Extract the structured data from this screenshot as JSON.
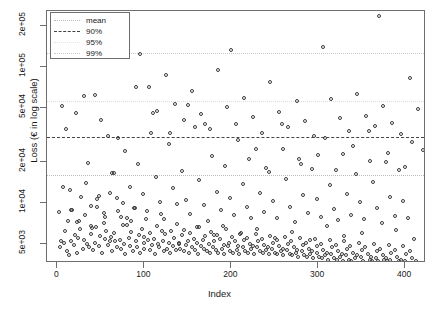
{
  "chart_data": {
    "type": "scatter",
    "title": "",
    "xlabel": "Index",
    "ylabel": "Loss (€ in log scale)",
    "xlim": [
      -12,
      424
    ],
    "ylim_log": [
      3600,
      260000
    ],
    "yscale": "log",
    "grid": false,
    "legend_position": "top-left",
    "xticks": [
      0,
      100,
      200,
      300,
      400
    ],
    "xticklabels": [
      "0",
      "100",
      "200",
      "300",
      "400"
    ],
    "yticks": [
      5000,
      10000,
      20000,
      50000,
      100000,
      200000
    ],
    "yticklabels": [
      "5e+03",
      "1e+04",
      "2e+04",
      "5e+04",
      "1e+05",
      "2e+05"
    ],
    "marker": "open-circle",
    "marker_color": "#3a3a3a",
    "n_points": 420,
    "reference_lines": [
      {
        "name": "mean",
        "label": "mean",
        "value": 16000,
        "style": "dotted",
        "color": "#bbbbbb",
        "width": 1
      },
      {
        "name": "q90",
        "label": "90%",
        "value": 30500,
        "style": "dashed",
        "color": "#444444",
        "width": 1
      },
      {
        "name": "q95",
        "label": "95%",
        "value": 56000,
        "style": "dotted",
        "color": "#dcdcdc",
        "width": 1
      },
      {
        "name": "q99",
        "label": "99%",
        "value": 128000,
        "style": "dotted",
        "color": "#c9c9c9",
        "width": 1
      }
    ],
    "legend_entries": [
      "mean",
      "90%",
      "95%",
      "99%"
    ],
    "x": [
      2,
      4,
      5,
      7,
      9,
      11,
      12,
      14,
      16,
      17,
      19,
      21,
      22,
      24,
      26,
      27,
      29,
      31,
      32,
      34,
      36,
      38,
      39,
      41,
      43,
      44,
      46,
      48,
      49,
      51,
      53,
      55,
      56,
      58,
      60,
      61,
      63,
      65,
      66,
      68,
      70,
      72,
      73,
      75,
      77,
      78,
      80,
      82,
      83,
      85,
      87,
      89,
      90,
      92,
      94,
      95,
      97,
      99,
      100,
      102,
      104,
      106,
      107,
      109,
      111,
      112,
      114,
      116,
      117,
      119,
      121,
      123,
      124,
      126,
      128,
      129,
      131,
      133,
      134,
      136,
      138,
      140,
      141,
      143,
      145,
      146,
      148,
      150,
      151,
      153,
      155,
      157,
      158,
      160,
      162,
      163,
      165,
      167,
      168,
      170,
      172,
      174,
      175,
      177,
      179,
      180,
      182,
      184,
      185,
      187,
      189,
      191,
      192,
      194,
      196,
      197,
      199,
      201,
      202,
      204,
      206,
      208,
      209,
      211,
      213,
      214,
      216,
      218,
      219,
      221,
      223,
      225,
      226,
      228,
      230,
      231,
      233,
      235,
      236,
      238,
      240,
      242,
      243,
      245,
      247,
      248,
      250,
      252,
      253,
      255,
      257,
      259,
      260,
      262,
      264,
      265,
      267,
      269,
      270,
      272,
      274,
      276,
      277,
      279,
      281,
      282,
      284,
      286,
      287,
      289,
      291,
      293,
      294,
      296,
      298,
      299,
      301,
      303,
      304,
      306,
      308,
      310,
      311,
      313,
      315,
      316,
      318,
      320,
      321,
      323,
      325,
      327,
      328,
      330,
      332,
      333,
      335,
      337,
      338,
      340,
      342,
      344,
      345,
      347,
      349,
      350,
      352,
      354,
      355,
      357,
      359,
      361,
      362,
      364,
      366,
      367,
      369,
      371,
      372,
      374,
      376,
      378,
      379,
      381,
      383,
      384,
      386,
      388,
      389,
      391,
      393,
      395,
      396,
      398,
      400,
      401,
      403,
      405,
      406,
      408,
      410,
      412,
      413,
      3,
      8,
      13,
      18,
      23,
      28,
      33,
      38,
      43,
      48,
      53,
      58,
      63,
      68,
      73,
      78,
      83,
      88,
      93,
      98,
      103,
      108,
      113,
      118,
      123,
      128,
      133,
      138,
      143,
      148,
      153,
      158,
      163,
      168,
      173,
      178,
      183,
      188,
      193,
      198,
      203,
      208,
      213,
      218,
      223,
      228,
      233,
      238,
      243,
      248,
      253,
      258,
      263,
      268,
      273,
      278,
      283,
      288,
      293,
      298,
      303,
      308,
      313,
      318,
      323,
      328,
      333,
      338,
      343,
      348,
      353,
      358,
      363,
      368,
      373,
      378,
      383,
      388,
      393,
      398,
      403,
      408,
      6,
      15,
      25,
      35,
      45,
      55,
      65,
      75,
      85,
      95,
      105,
      115,
      125,
      135,
      145,
      155,
      165,
      175,
      185,
      195,
      205,
      215,
      225,
      235,
      245,
      255,
      265,
      275,
      285,
      295,
      305,
      315,
      325,
      335,
      345,
      355,
      365,
      375,
      385,
      395,
      405,
      415,
      10,
      30,
      50,
      70,
      90,
      110,
      130,
      150,
      170,
      190,
      210,
      230,
      250,
      270,
      290,
      310,
      330,
      350,
      370,
      390,
      410,
      20,
      40,
      60,
      80,
      100,
      120,
      140,
      160,
      180,
      200,
      220,
      240,
      260,
      280,
      300,
      320,
      340,
      360,
      380,
      400,
      420
    ],
    "y": [
      8600,
      5200,
      52000,
      5100,
      6200,
      4400,
      7400,
      12500,
      5200,
      8900,
      4900,
      46000,
      7200,
      5500,
      6400,
      11000,
      4600,
      5300,
      8200,
      5000,
      4700,
      6800,
      5900,
      4500,
      5100,
      6600,
      9400,
      4800,
      5700,
      4300,
      7100,
      5400,
      6200,
      4900,
      11800,
      5600,
      4400,
      6000,
      5200,
      4700,
      8700,
      5300,
      4600,
      6900,
      5000,
      4200,
      7800,
      5500,
      4800,
      6100,
      4400,
      9200,
      5200,
      4700,
      5800,
      4300,
      6400,
      5100,
      4600,
      7600,
      5300,
      4500,
      6000,
      4900,
      5400,
      4200,
      6700,
      5000,
      4700,
      8300,
      5200,
      4400,
      5900,
      4600,
      5100,
      4300,
      6200,
      4800,
      5500,
      4500,
      7000,
      5000,
      4600,
      5800,
      4400,
      6300,
      4900,
      5200,
      4300,
      6000,
      4700,
      5400,
      4500,
      5100,
      4200,
      6600,
      4800,
      5300,
      4600,
      5700,
      4400,
      5000,
      4300,
      6100,
      4700,
      5200,
      4500,
      5800,
      4300,
      5400,
      4600,
      4900,
      4200,
      6400,
      4800,
      5100,
      4400,
      5600,
      4300,
      5200,
      4500,
      4800,
      4200,
      6000,
      4700,
      5300,
      4400,
      5500,
      4300,
      5000,
      4600,
      4800,
      4200,
      5900,
      4700,
      5200,
      4400,
      5400,
      4300,
      4900,
      4500,
      4700,
      4200,
      5700,
      4600,
      5100,
      4300,
      5300,
      4200,
      4800,
      4400,
      4600,
      4100,
      5600,
      4500,
      5000,
      4200,
      5200,
      4100,
      4700,
      4300,
      4500,
      4000,
      5500,
      4400,
      4900,
      4100,
      5100,
      4000,
      4600,
      4200,
      4400,
      3900,
      5400,
      4300,
      4800,
      4000,
      5000,
      3900,
      4500,
      4100,
      4300,
      3800,
      5300,
      4200,
      4700,
      3900,
      4900,
      3800,
      4400,
      4000,
      4200,
      3700,
      5200,
      4100,
      4600,
      3800,
      4800,
      3700,
      4300,
      3900,
      4100,
      3600,
      5100,
      4000,
      4500,
      3700,
      4700,
      3600,
      4200,
      3800,
      4000,
      3700,
      5000,
      3900,
      4400,
      3700,
      4600,
      3600,
      4100,
      3800,
      3900,
      3700,
      4900,
      3800,
      4300,
      3600,
      4500,
      3600,
      4000,
      3700,
      3800,
      3600,
      4800,
      3700,
      4200,
      3600,
      4400,
      3600,
      3900,
      3600,
      3700,
      3600,
      4700,
      3600,
      4100,
      3600,
      4300,
      3600,
      14000,
      9500,
      62000,
      11200,
      8400,
      31000,
      16500,
      10800,
      7900,
      24000,
      13200,
      9100,
      19500,
      11600,
      8700,
      33000,
      15400,
      10200,
      7600,
      27000,
      12800,
      9800,
      17200,
      10500,
      8300,
      36000,
      14700,
      9600,
      7400,
      22000,
      12100,
      8900,
      18600,
      10900,
      8100,
      29000,
      13800,
      9300,
      7700,
      25000,
      11900,
      8600,
      16800,
      10300,
      7800,
      38000,
      15100,
      9400,
      7200,
      21000,
      11400,
      8400,
      17900,
      10600,
      7900,
      30000,
      13500,
      9000,
      7500,
      23000,
      11700,
      8200,
      16200,
      10100,
      7600,
      34000,
      14300,
      9200,
      7100,
      20000,
      11100,
      8000,
      17500,
      10400,
      7700,
      28000,
      13100,
      8800,
      7300,
      19800,
      10700,
      7900,
      16600,
      9900,
      7400,
      125000,
      72000,
      48000,
      88000,
      54000,
      41000,
      67000,
      45000,
      35000,
      96000,
      51000,
      38000,
      59000,
      43000,
      33000,
      78000,
      47000,
      36000,
      56000,
      40000,
      31000,
      142000,
      58000,
      42000,
      34000,
      64000,
      44000,
      37000,
      52000,
      39000,
      32000,
      83000,
      49000,
      35000,
      61000,
      41000,
      30000,
      71000,
      46000,
      33000,
      53000,
      38000,
      6800,
      5900,
      6400,
      5500,
      6100,
      5300,
      6700,
      5700,
      6000,
      238000,
      6300,
      5400,
      5800,
      6500,
      5200,
      6900,
      5600,
      6200,
      5100,
      6600,
      5800,
      135000,
      21000,
      18000,
      25000,
      19500,
      22500,
      17500,
      26500,
      20500,
      23500,
      18500,
      24500,
      19000,
      27500,
      21500,
      16500,
      23000,
      20000,
      25500,
      18000,
      22000
    ]
  },
  "axes": {
    "y_title": "Loss (€ in log scale)",
    "x_title": "Index"
  }
}
